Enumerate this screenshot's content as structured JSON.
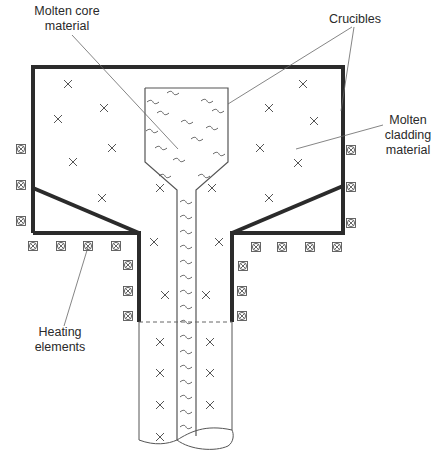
{
  "diagram": {
    "type": "double-crucible fiber drawing schematic",
    "labels": {
      "core": {
        "line1": "Molten core",
        "line2": "material"
      },
      "crucibles": {
        "line1": "Crucibles"
      },
      "cladding": {
        "line1": "Molten",
        "line2": "cladding",
        "line3": "material"
      },
      "heating": {
        "line1": "Heating",
        "line2": "elements"
      }
    },
    "colors": {
      "outer_crucible": "#2b2b2b",
      "inner_crucible": "#555555",
      "leader_line": "#666666",
      "text": "#2a2a2a",
      "background": "#ffffff"
    },
    "heating_element_symbol": "circled-x",
    "cladding_symbol": "x-mark",
    "core_symbol": "tilde-wave"
  }
}
